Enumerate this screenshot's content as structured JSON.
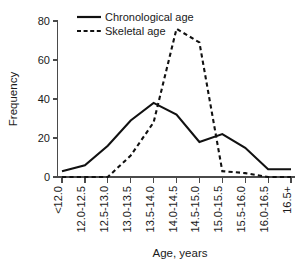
{
  "chart_data": {
    "type": "line",
    "title": "",
    "xlabel": "Age, years",
    "ylabel": "Frequency",
    "categories": [
      "<12.0",
      "12.0-12.5",
      "12.5-13.0",
      "13.0-13.5",
      "13.5-14.0",
      "14.0-14.5",
      "14.5-15.0",
      "15.0-15.5",
      "15.5-16.0",
      "16.0-16.5",
      "16.5+"
    ],
    "series": [
      {
        "name": "Chronological age",
        "style": "solid",
        "values": [
          3,
          6,
          16,
          29,
          38,
          32,
          18,
          22,
          15,
          4,
          4
        ]
      },
      {
        "name": "Skeletal age",
        "style": "dashed",
        "values": [
          0,
          0,
          0,
          11,
          28,
          76,
          69,
          3,
          2,
          0,
          0
        ]
      }
    ],
    "ylim": [
      0,
      80
    ],
    "yticks": [
      0,
      20,
      40,
      60,
      80
    ],
    "grid": false,
    "legend_position": "top-center",
    "line_color": "#111111"
  },
  "axes": {
    "y_title": "Frequency",
    "x_title": "Age, years",
    "y_tick_labels": [
      "0",
      "20",
      "40",
      "60",
      "80"
    ],
    "x_tick_labels": [
      "<12.0",
      "12.0-12.5",
      "12.5-13.0",
      "13.0-13.5",
      "13.5-14.0",
      "14.0-14.5",
      "14.5-15.0",
      "15.0-15.5",
      "15.5-16.0",
      "16.0-16.5",
      "16.5+"
    ]
  },
  "legend": {
    "items": [
      {
        "label": "Chronological age",
        "style": "solid"
      },
      {
        "label": "Skeletal age",
        "style": "dashed"
      }
    ]
  }
}
